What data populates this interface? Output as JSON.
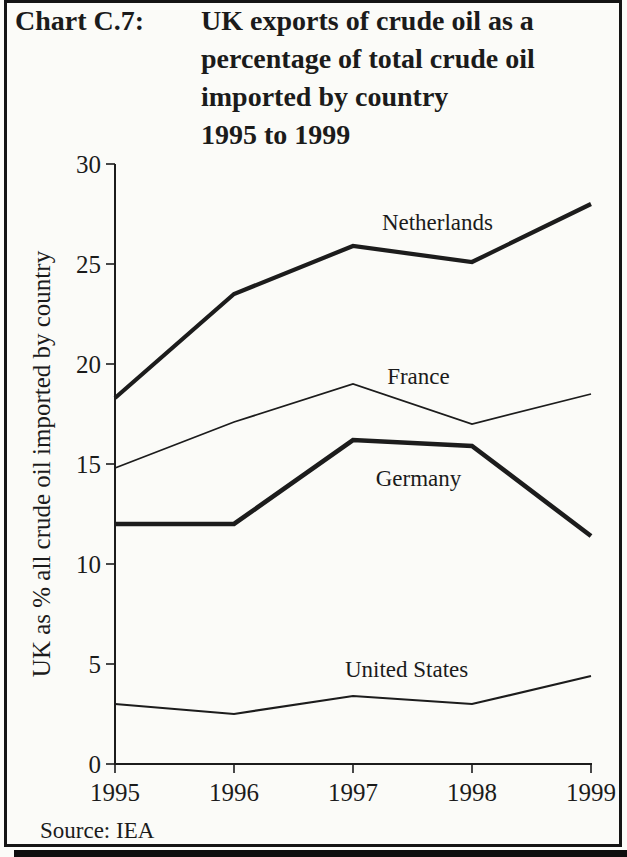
{
  "header": {
    "label": "Chart C.7:",
    "title_lines": [
      "UK exports of crude oil as a",
      "percentage of total crude oil",
      "imported by country",
      "1995 to 1999"
    ]
  },
  "y_axis_label": "UK as % all crude oil imported by country",
  "source": "Source: IEA",
  "ink_color": "#1c1c1c",
  "chart_data": {
    "type": "line",
    "title": "UK exports of crude oil as a percentage of total crude oil imported by country 1995 to 1999",
    "xlabel": "",
    "ylabel": "UK as % all crude oil imported by country",
    "x": [
      1995,
      1996,
      1997,
      1998,
      1999
    ],
    "x_tick_labels": [
      "1995",
      "1996",
      "1997",
      "1998",
      "1999"
    ],
    "y_ticks": [
      0,
      5,
      10,
      15,
      20,
      25,
      30
    ],
    "ylim": [
      0,
      30
    ],
    "grid": false,
    "legend": "inline-labels",
    "source": "Source: IEA",
    "series": [
      {
        "name": "Netherlands",
        "values": [
          18.3,
          23.5,
          25.9,
          25.1,
          28.0
        ],
        "line_weight_px": 4.2,
        "label_anchor": {
          "year": 1997.71,
          "value": 27.1
        }
      },
      {
        "name": "France",
        "values": [
          14.8,
          17.1,
          19.0,
          17.0,
          18.5
        ],
        "line_weight_px": 1.8,
        "label_anchor": {
          "year": 1997.55,
          "value": 19.4
        }
      },
      {
        "name": "Germany",
        "values": [
          12.0,
          12.0,
          16.2,
          15.9,
          11.4
        ],
        "line_weight_px": 4.6,
        "label_anchor": {
          "year": 1997.55,
          "value": 14.3
        }
      },
      {
        "name": "United States",
        "values": [
          3.0,
          2.5,
          3.4,
          3.0,
          4.4
        ],
        "line_weight_px": 2.2,
        "label_anchor": {
          "year": 1997.45,
          "value": 4.75
        }
      }
    ]
  }
}
